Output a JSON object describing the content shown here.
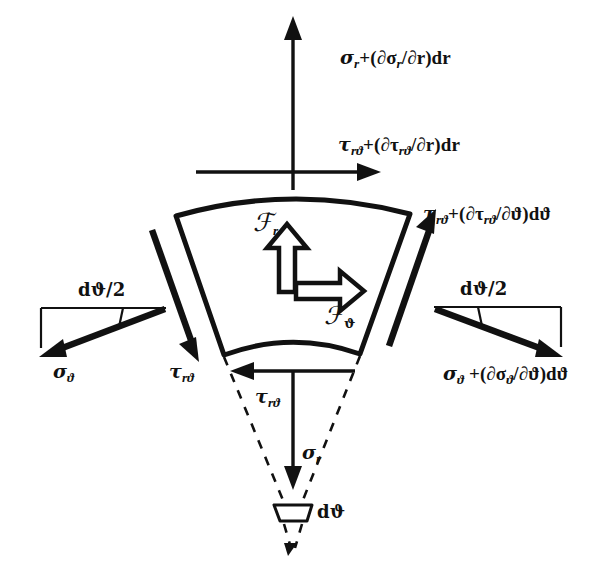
{
  "figure": {
    "background_color": "#ffffff",
    "ink_color": "#111111",
    "width": 605,
    "height": 586
  },
  "labels": {
    "sigma_r_outer": "σr+(∂σr/∂r)dr",
    "tau_rtheta_outer": "τrϑ+(∂τrϑ/∂r)dr",
    "tau_rtheta_right": "τrϑ+(∂τrϑ/∂ϑ)dϑ",
    "sigma_theta_right": "σϑ +(∂σϑ/∂ϑ)dϑ",
    "sigma_theta_left": "σϑ",
    "tau_rtheta_left": "τrϑ",
    "tau_rtheta_inner": "τrϑ",
    "sigma_r_inner": "σr",
    "body_force_r": "ℱr",
    "body_force_theta": "ℱϑ",
    "half_angle_left": "dϑ/2",
    "half_angle_right": "dϑ/2",
    "apex_angle": "dϑ"
  },
  "symbols": {
    "sigma": "σ",
    "tau": "τ",
    "theta": "ϑ",
    "partial": "∂",
    "script_f": "ℱ",
    "r": "r",
    "d": "d"
  },
  "label_parts": {
    "sigma_r_outer": {
      "main": "σ",
      "main_sub": "r",
      "tail": "+(∂σ",
      "tail_sub": "r",
      "tail2": "/∂r)dr"
    },
    "tau_rtheta_outer": {
      "main": "τ",
      "main_sub": "rϑ",
      "tail": "+(∂τ",
      "tail_sub": "rϑ",
      "tail2": "/∂r)dr"
    },
    "tau_rtheta_right": {
      "main": "τ",
      "main_sub": "rϑ",
      "tail": "+(∂τ",
      "tail_sub": "rϑ",
      "tail2": "/∂ϑ)dϑ"
    },
    "sigma_theta_right": {
      "main": "σ",
      "main_sub": "ϑ",
      "tail": " +(∂σ",
      "tail_sub": "ϑ",
      "tail2": "/∂ϑ)dϑ"
    },
    "sigma_theta_left": {
      "main": "σ",
      "main_sub": "ϑ"
    },
    "tau_rtheta_left": {
      "main": "τ",
      "main_sub": "rϑ"
    },
    "tau_rtheta_inner": {
      "main": "τ",
      "main_sub": "rϑ"
    },
    "sigma_r_inner": {
      "main": "σ",
      "main_sub": "r"
    },
    "body_force_r": {
      "main": "ℱ",
      "main_sub": "r"
    },
    "body_force_theta": {
      "main": "ℱ",
      "main_sub": "ϑ"
    },
    "half_angle_left": {
      "main": "dϑ/2"
    },
    "half_angle_right": {
      "main": "dϑ/2"
    },
    "apex_angle": {
      "main": "dϑ"
    }
  },
  "geometry": {
    "element": {
      "description": "annular sector with curved outer and inner arcs and straight radial sides",
      "outer_arc": "M 176,216 Q 292,184 410,214",
      "inner_arc": "M 224,355 Q 292,331 360,354",
      "left_side": "M 176,216 L 224,355",
      "right_side": "M 410,214 L 360,354"
    },
    "apex": {
      "x": 293,
      "y": 516
    },
    "dashed_left": "M 224,357 L 285,508",
    "dashed_right": "M 360,356 L 301,508",
    "dashed_tail_left": "M 285,524 L 292,549",
    "dashed_tail_right": "M 301,524 L 294,549",
    "apex_marker": "M 275,506 L 311,506 L 307,521 L 279,521 Z"
  },
  "arrows": [
    {
      "name": "sigma-r-outer-arrow",
      "direction": "up",
      "from": [
        293,
        186
      ],
      "to": [
        293,
        22
      ],
      "style": "thin"
    },
    {
      "name": "tau-rtheta-outer-arrow",
      "direction": "right",
      "from": [
        196,
        172
      ],
      "to": [
        377,
        172
      ],
      "style": "thin"
    },
    {
      "name": "tau-rtheta-right-arrow",
      "direction": "up-right",
      "from": [
        390,
        345
      ],
      "to": [
        434,
        215
      ],
      "style": "thick"
    },
    {
      "name": "sigma-theta-right-arrow",
      "direction": "down-right",
      "from": [
        434,
        310
      ],
      "to": [
        560,
        357
      ],
      "style": "thick"
    },
    {
      "name": "sigma-theta-left-arrow",
      "direction": "down-left",
      "from": [
        165,
        308
      ],
      "to": [
        42,
        357
      ],
      "style": "thick"
    },
    {
      "name": "tau-rtheta-left-arrow",
      "direction": "down-right",
      "from": [
        152,
        228
      ],
      "to": [
        197,
        358
      ],
      "style": "thick"
    },
    {
      "name": "tau-rtheta-inner-arrow",
      "direction": "left",
      "from": [
        352,
        371
      ],
      "to": [
        235,
        371
      ],
      "style": "thin"
    },
    {
      "name": "sigma-r-inner-arrow",
      "direction": "down",
      "from": [
        293,
        371
      ],
      "to": [
        293,
        486
      ],
      "style": "thin"
    },
    {
      "name": "body-force-r-arrow",
      "direction": "up",
      "style": "hollow"
    },
    {
      "name": "body-force-theta-arrow",
      "direction": "right",
      "style": "hollow"
    }
  ],
  "angle_wedges": {
    "left": {
      "top_line": "M 42,308 L 165,308",
      "vertical_line": "M 42,308 L 42,348",
      "tick": "M 123,308 L 119,326"
    },
    "right": {
      "top_line": "M 434,307 L 560,307",
      "vertical_line": "M 560,307 L 560,348",
      "tick": "M 477,307 L 481,325"
    }
  }
}
